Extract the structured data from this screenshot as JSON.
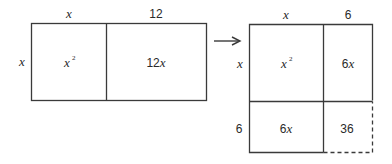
{
  "left_figure": {
    "top_labels": {
      "left": "x",
      "right": "12"
    },
    "side_label": "x",
    "cells": [
      {
        "id": "x-squared",
        "base": "x",
        "exponent": "2"
      },
      {
        "id": "twelve-x",
        "coef": "12",
        "var": "x"
      }
    ]
  },
  "arrow": {
    "direction": "right"
  },
  "right_figure": {
    "top_labels": {
      "left": "x",
      "right": "6"
    },
    "side_labels": {
      "top": "x",
      "bottom": "6"
    },
    "cells": {
      "top_left": {
        "base": "x",
        "exponent": "2"
      },
      "top_right": {
        "coef": "6",
        "var": "x"
      },
      "bottom_left": {
        "coef": "6",
        "var": "x"
      },
      "bottom_right": {
        "value": "36"
      }
    },
    "dashed_edges": [
      "right-bottom-cell-right",
      "right-bottom-cell-bottom"
    ]
  },
  "colors": {
    "line": "#3a3a3a",
    "text": "#2a2a2a",
    "background": "#ffffff"
  }
}
